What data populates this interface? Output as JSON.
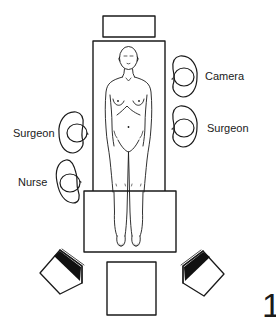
{
  "diagram": {
    "type": "operating-room-layout",
    "labels": {
      "camera": "Camera",
      "surgeon_right": "Surgeon",
      "surgeon_left": "Surgeon",
      "nurse": "Nurse"
    },
    "figure_number": "1",
    "elements": [
      {
        "id": "head-equipment",
        "shape": "rectangle"
      },
      {
        "id": "operating-table",
        "shape": "rectangle"
      },
      {
        "id": "table-foot-extension",
        "shape": "rectangle"
      },
      {
        "id": "patient",
        "shape": "human-figure-supine"
      },
      {
        "id": "person-camera",
        "shape": "person-topview",
        "label": "Camera"
      },
      {
        "id": "person-surgeon-right",
        "shape": "person-topview",
        "label": "Surgeon"
      },
      {
        "id": "person-surgeon-left",
        "shape": "person-topview",
        "label": "Surgeon"
      },
      {
        "id": "person-nurse",
        "shape": "person-topview",
        "label": "Nurse"
      },
      {
        "id": "monitor-left",
        "shape": "monitor-angled"
      },
      {
        "id": "monitor-right",
        "shape": "monitor-angled"
      },
      {
        "id": "foot-equipment-cart",
        "shape": "square"
      }
    ],
    "colors": {
      "stroke": "#1a1a1a",
      "background": "#ffffff",
      "screen_fill": "#111111"
    }
  }
}
